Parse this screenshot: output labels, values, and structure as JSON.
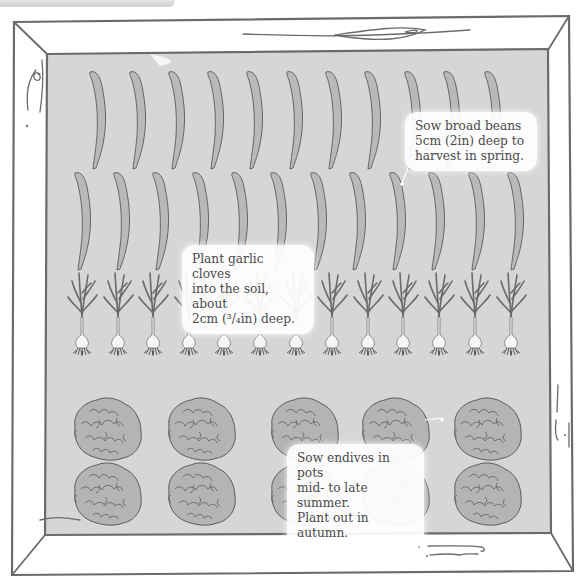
{
  "diagram": {
    "colors": {
      "bed_fill": "#d6d6d6",
      "frame_stroke": "#6b6b6b",
      "plant_fill": "#b9b9b9",
      "plant_stroke": "#5a5a5a",
      "callout_bg": "#ffffff",
      "text": "#4a4a4a"
    },
    "rows": [
      {
        "crop": "broad beans",
        "icon": "bean-pod-icon",
        "count": 11,
        "y": 68
      },
      {
        "crop": "broad beans",
        "icon": "bean-pod-icon",
        "count": 12,
        "y": 173
      },
      {
        "crop": "garlic",
        "icon": "garlic-plant-icon",
        "count": 13,
        "y": 273
      },
      {
        "crop": "endive",
        "icon": "endive-head-icon",
        "count": 5,
        "y": 400
      },
      {
        "crop": "endive",
        "icon": "endive-head-icon",
        "count": 5,
        "y": 467
      }
    ],
    "callouts": [
      {
        "id": "beans",
        "text": "Sow broad beans\n5cm (2in) deep to\nharvest in spring."
      },
      {
        "id": "garlic",
        "text": "Plant garlic cloves\ninto the soil, about\n2cm (³/₄in) deep."
      },
      {
        "id": "endives",
        "text": "Sow endives in pots\nmid- to late summer.\nPlant out in autumn."
      }
    ]
  }
}
